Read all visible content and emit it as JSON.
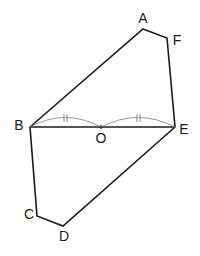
{
  "diagram": {
    "type": "geometry-figure",
    "stroke_color": "#1a1a1a",
    "points": {
      "A": {
        "label": "A",
        "x": 143,
        "y": 29
      },
      "F": {
        "label": "F",
        "x": 167,
        "y": 38
      },
      "E": {
        "label": "E",
        "x": 175,
        "y": 127
      },
      "D": {
        "label": "D",
        "x": 63,
        "y": 226
      },
      "C": {
        "label": "C",
        "x": 37,
        "y": 216
      },
      "B": {
        "label": "B",
        "x": 30,
        "y": 127
      },
      "O": {
        "label": "O",
        "x": 101,
        "y": 127
      }
    },
    "polygon": [
      "A",
      "F",
      "E",
      "D",
      "C",
      "B"
    ],
    "segments": [
      [
        "B",
        "E"
      ]
    ],
    "equal_marks": [
      {
        "from": "B",
        "to": "O",
        "mark": "double-tick"
      },
      {
        "from": "O",
        "to": "E",
        "mark": "double-tick"
      }
    ],
    "labels": {
      "A": "A",
      "F": "F",
      "B": "B",
      "O": "O",
      "E": "E",
      "C": "C",
      "D": "D"
    }
  }
}
